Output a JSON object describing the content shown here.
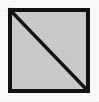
{
  "figure": {
    "description": "A black-outlined square filled with light gray, crossed by a straight diagonal line running from the top-left corner to the bottom-right corner, splitting it into two congruent right triangles.",
    "background_color": "#fdfdfd",
    "canvas": {
      "width": 99,
      "height": 102
    }
  },
  "shapes": {
    "square": {
      "name": "square",
      "x": 8,
      "y": 8,
      "width": 82,
      "height": 85,
      "fill_color": "#cdcdcd",
      "stroke_color": "#111111",
      "stroke_width": 4
    },
    "diagonal": {
      "name": "diagonal-line",
      "x1": 10,
      "y1": 10,
      "x2": 88,
      "y2": 91,
      "stroke_color": "#141414",
      "stroke_width": 3.4,
      "direction": "top-left to bottom-right"
    },
    "triangles": [
      {
        "name": "lower-left-triangle",
        "fill_color": "#cdcdcd",
        "vertices": "top-left, bottom-left, bottom-right"
      },
      {
        "name": "upper-right-triangle",
        "fill_color": "#cdcdcd",
        "vertices": "top-left, top-right, bottom-right"
      }
    ]
  },
  "labels": {
    "visible_text": ""
  }
}
